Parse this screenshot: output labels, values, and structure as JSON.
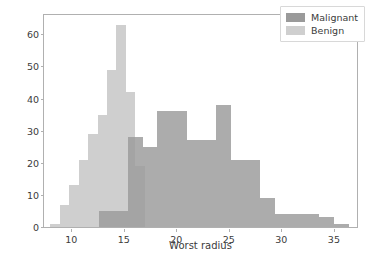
{
  "chart_data": {
    "type": "bar",
    "subtype": "histogram-overlay",
    "title": "",
    "xlabel": "Worst radius",
    "ylabel": "",
    "xlim": [
      7.4,
      37.2
    ],
    "ylim": [
      0,
      66
    ],
    "xticks": [
      10,
      15,
      20,
      25,
      30,
      35
    ],
    "xticklabels": [
      "10",
      "15",
      "20",
      "25",
      "30",
      "35"
    ],
    "yticks": [
      0,
      10,
      20,
      30,
      40,
      50,
      60
    ],
    "yticklabels": [
      "0",
      "10",
      "20",
      "30",
      "40",
      "50",
      "60"
    ],
    "grid": false,
    "legend_position": "upper right",
    "bin_width": 1.4,
    "series": [
      {
        "name": "Malignant",
        "color": "#9a9a9a",
        "bins": [
          12.6,
          14.0,
          15.4,
          16.8,
          18.2,
          19.6,
          21.0,
          22.4,
          23.8,
          25.2,
          26.6,
          28.0,
          29.4,
          30.8,
          32.2,
          33.6,
          35.0,
          36.4
        ],
        "values": [
          5,
          5,
          28,
          25,
          36,
          36,
          27,
          27,
          38,
          21,
          21,
          9,
          4,
          4,
          4,
          3,
          1
        ]
      },
      {
        "name": "Benign",
        "color": "#cfcfcf",
        "bins": [
          8.0,
          8.9,
          9.8,
          10.7,
          11.6,
          12.5,
          13.4,
          14.3,
          15.2,
          16.1,
          17.0
        ],
        "values": [
          1,
          7,
          13,
          21,
          29,
          35,
          49,
          63,
          42,
          19
        ]
      }
    ],
    "legend": [
      {
        "label": "Malignant",
        "color": "#9a9a9a"
      },
      {
        "label": "Benign",
        "color": "#cfcfcf"
      }
    ]
  }
}
